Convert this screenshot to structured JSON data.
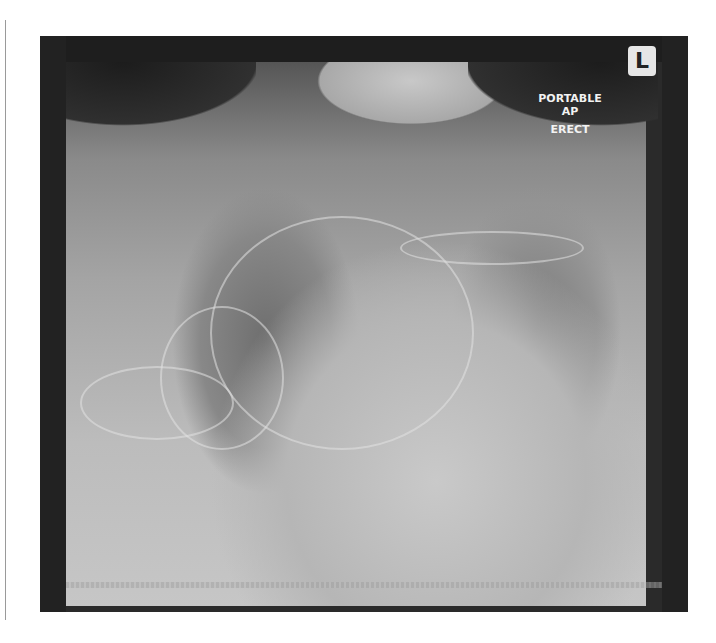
{
  "image": {
    "description": "Portable AP erect chest radiograph with lines/leads overlying the chest",
    "side_marker": "L",
    "annotations": {
      "line1": "PORTABLE",
      "line2": "AP",
      "line3": "ERECT"
    },
    "colors": {
      "background": "#ffffff",
      "film_border": "#2a2a2a",
      "annotation_text": "#f2f2f2",
      "marker_bg": "#e6e6e6"
    }
  }
}
